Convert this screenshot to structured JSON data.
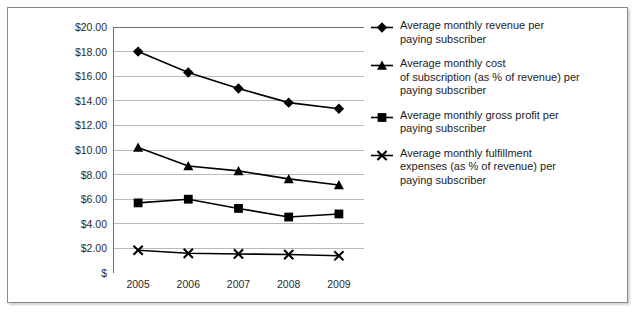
{
  "chart_data": {
    "type": "line",
    "title": "",
    "subtitle": "",
    "xlabel": "",
    "ylabel": "",
    "categories": [
      "2005",
      "2006",
      "2007",
      "2008",
      "2009"
    ],
    "x_tick_labels": [
      "2005",
      "2006",
      "2007",
      "2008",
      "2009"
    ],
    "y_tick_labels": [
      "$20.00",
      "$18.00",
      "$16.00",
      "$14.00",
      "$12.00",
      "$10.00",
      "$8.00",
      "$6.00",
      "$4.00",
      "$2.00",
      "$"
    ],
    "y_tick_values": [
      20,
      18,
      16,
      14,
      12,
      10,
      8,
      6,
      4,
      2,
      0
    ],
    "ylim": [
      0,
      20
    ],
    "grid": "horizontal",
    "legend_position": "right",
    "currency": "USD",
    "series": [
      {
        "name": "Average monthly revenue per\npaying subscriber",
        "marker": "diamond",
        "color": "#000000",
        "values": [
          18.0,
          16.3,
          15.0,
          13.85,
          13.35
        ]
      },
      {
        "name": "Average monthly cost\nof subscription (as % of revenue) per\npaying subscriber",
        "marker": "triangle",
        "color": "#000000",
        "values": [
          10.2,
          8.7,
          8.3,
          7.65,
          7.15
        ]
      },
      {
        "name": "Average monthly gross profit per\npaying subscriber",
        "marker": "square",
        "color": "#000000",
        "values": [
          5.7,
          6.0,
          5.25,
          4.55,
          4.8
        ]
      },
      {
        "name": "Average monthly fulfillment\nexpenses (as % of revenue) per\npaying subscriber",
        "marker": "x",
        "color": "#000000",
        "values": [
          1.85,
          1.6,
          1.55,
          1.5,
          1.4
        ]
      }
    ]
  },
  "legend": {
    "items": [
      {
        "label": "Average monthly revenue per\npaying subscriber",
        "marker": "diamond"
      },
      {
        "label": "Average monthly cost\nof subscription (as % of revenue) per\npaying subscriber",
        "marker": "triangle"
      },
      {
        "label": "Average monthly gross profit per\npaying subscriber",
        "marker": "square"
      },
      {
        "label": "Average monthly fulfillment\nexpenses (as % of revenue) per\npaying subscriber",
        "marker": "x"
      }
    ]
  },
  "style": {
    "plot_line_color": "#000000",
    "gridline_color": "#b9b9b9",
    "axis_color": "#6f6f6f",
    "frame_color": "#8a8a8a",
    "text_color": "#1c1c1c",
    "background": "#ffffff"
  }
}
